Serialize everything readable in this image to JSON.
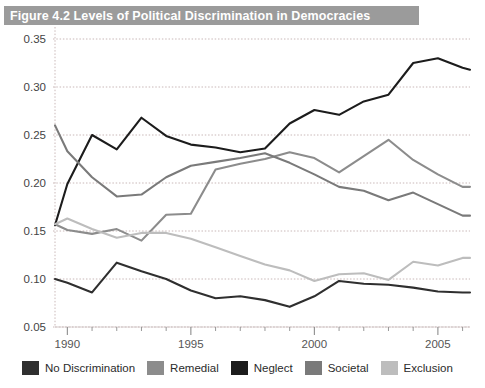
{
  "figure": {
    "title": "Figure 4.2   Levels of Political Discrimination in Democracies",
    "title_bar_color": "#9b9b9b",
    "background": "#ffffff"
  },
  "legend": {
    "position": "bottom",
    "items": [
      {
        "label": "No Discrimination",
        "color": "#2f2f2f",
        "swatch": "legend-swatch-no-discrimination"
      },
      {
        "label": "Remedial",
        "color": "#8c8c8c",
        "swatch": "legend-swatch-remedial"
      },
      {
        "label": "Neglect",
        "color": "#1c1c1c",
        "swatch": "legend-swatch-neglect"
      },
      {
        "label": "Societal",
        "color": "#7a7a7a",
        "swatch": "legend-swatch-societal"
      },
      {
        "label": "Exclusion",
        "color": "#bdbdbd",
        "swatch": "legend-swatch-exclusion"
      }
    ]
  },
  "axes": {
    "y_ticks": [
      "0.35",
      "0.30",
      "0.25",
      "0.20",
      "0.15",
      "0.10",
      "0.05"
    ],
    "x_ticks": [
      "1990",
      "1995",
      "2000",
      "2005"
    ],
    "y_min": 0.05,
    "y_max": 0.35,
    "x_min": 1989.5,
    "x_max": 2006.3,
    "grid": true
  },
  "chart_data": {
    "type": "line",
    "title": "Figure 4.2   Levels of Political Discrimination in Democracies",
    "xlabel": "",
    "ylabel": "",
    "xlim": [
      1989.5,
      2006.3
    ],
    "ylim": [
      0.05,
      0.35
    ],
    "grid": true,
    "legend_position": "bottom",
    "x": [
      1989.5,
      1990,
      1991,
      1992,
      1993,
      1994,
      1995,
      1996,
      1997,
      1998,
      1999,
      2000,
      2001,
      2002,
      2003,
      2004,
      2005,
      2006,
      2006.3
    ],
    "series": [
      {
        "name": "No Discrimination",
        "color": "#2f2f2f",
        "values": [
          0.1,
          0.096,
          0.086,
          0.117,
          0.108,
          0.1,
          0.088,
          0.08,
          0.082,
          0.078,
          0.071,
          0.082,
          0.098,
          0.095,
          0.094,
          0.091,
          0.087,
          0.086,
          0.086
        ]
      },
      {
        "name": "Remedial",
        "color": "#8c8c8c",
        "values": [
          0.157,
          0.151,
          0.147,
          0.152,
          0.14,
          0.167,
          0.168,
          0.214,
          0.22,
          0.225,
          0.232,
          0.226,
          0.211,
          0.228,
          0.245,
          0.224,
          0.209,
          0.196,
          0.196
        ]
      },
      {
        "name": "Neglect",
        "color": "#1c1c1c",
        "values": [
          0.156,
          0.199,
          0.25,
          0.235,
          0.268,
          0.249,
          0.24,
          0.237,
          0.232,
          0.236,
          0.262,
          0.276,
          0.271,
          0.285,
          0.292,
          0.325,
          0.33,
          0.32,
          0.318
        ]
      },
      {
        "name": "Societal",
        "color": "#7a7a7a",
        "values": [
          0.26,
          0.233,
          0.206,
          0.186,
          0.188,
          0.206,
          0.218,
          0.222,
          0.226,
          0.231,
          0.221,
          0.209,
          0.196,
          0.192,
          0.182,
          0.19,
          0.178,
          0.166,
          0.166
        ]
      },
      {
        "name": "Exclusion",
        "color": "#bdbdbd",
        "values": [
          0.157,
          0.163,
          0.152,
          0.143,
          0.148,
          0.148,
          0.142,
          0.133,
          0.124,
          0.115,
          0.109,
          0.098,
          0.105,
          0.106,
          0.099,
          0.118,
          0.114,
          0.122,
          0.122
        ]
      }
    ]
  }
}
